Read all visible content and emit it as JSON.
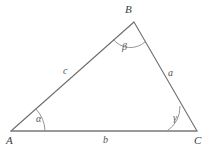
{
  "figure": {
    "type": "geometry-diagram",
    "shape": "triangle",
    "background_color": "#ffffff",
    "stroke_color": "#6e6e6e",
    "label_color": "#4a4a4a",
    "vertices": [
      {
        "name": "A",
        "label": "A",
        "x": 11,
        "y": 131
      },
      {
        "name": "B",
        "label": "B",
        "x": 134,
        "y": 22
      },
      {
        "name": "C",
        "label": "C",
        "x": 197,
        "y": 131
      }
    ],
    "sides": [
      {
        "name": "side-c",
        "label": "c",
        "between": "A-B"
      },
      {
        "name": "side-a",
        "label": "a",
        "between": "B-C"
      },
      {
        "name": "side-b",
        "label": "b",
        "between": "A-C"
      }
    ],
    "angles": [
      {
        "name": "angle-alpha",
        "label": "α",
        "at_vertex": "A"
      },
      {
        "name": "angle-beta",
        "label": "β",
        "at_vertex": "B"
      },
      {
        "name": "angle-gamma",
        "label": "γ",
        "at_vertex": "C"
      }
    ]
  }
}
